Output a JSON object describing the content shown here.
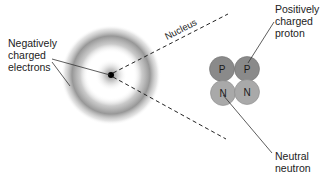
{
  "diagram": {
    "type": "atom-structure",
    "atom_center": [
      111,
      75
    ],
    "electron_cloud": {
      "inner_ring_radius": 14,
      "outer_ring_radius": 40,
      "color": "#8c8c8c"
    },
    "nucleus_dot": {
      "color": "#000000",
      "radius": 3
    },
    "nucleus_zoom_lines": {
      "label": "Nucleus",
      "style": "dashed"
    },
    "particles": [
      {
        "symbol": "P",
        "kind": "proton",
        "cx": 222,
        "cy": 69,
        "r": 12,
        "color": "#8a8a8a"
      },
      {
        "symbol": "P",
        "kind": "proton",
        "cx": 247,
        "cy": 69,
        "r": 12,
        "color": "#8a8a8a"
      },
      {
        "symbol": "N",
        "kind": "neutron",
        "cx": 223,
        "cy": 93,
        "r": 12,
        "color": "#a9a9a9"
      },
      {
        "symbol": "N",
        "kind": "neutron",
        "cx": 247,
        "cy": 92,
        "r": 12,
        "color": "#a9a9a9"
      }
    ],
    "labels": {
      "electrons": "Negatively\ncharged\nelectrons",
      "proton": "Positively\ncharged\nproton",
      "neutron": "Neutral\nneutron",
      "nucleus": "Nucleus"
    }
  }
}
